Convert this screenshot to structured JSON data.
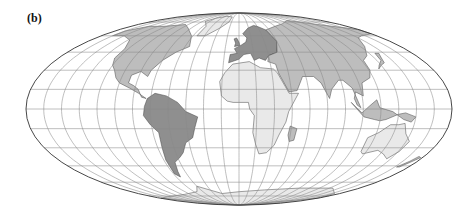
{
  "figure": {
    "panel_label": "(b)",
    "projection": "Mollweide",
    "graticule_spacing_deg": 15,
    "colors": {
      "background": "#ffffff",
      "graticule": "#8a8a8a",
      "outline": "#333333",
      "land_light": "#e9e9e9",
      "land_medium": "#bdbdbd",
      "land_dark": "#8f8f8f",
      "coastline": "#444444"
    },
    "frame": {
      "cx": 239,
      "cy": 109,
      "rx": 213,
      "ry": 96
    },
    "regions": [
      {
        "name": "north-america",
        "shade": "land_medium",
        "pts": [
          [
            -165,
            65
          ],
          [
            -150,
            70
          ],
          [
            -125,
            70
          ],
          [
            -95,
            72
          ],
          [
            -80,
            68
          ],
          [
            -62,
            60
          ],
          [
            -55,
            50
          ],
          [
            -66,
            45
          ],
          [
            -75,
            38
          ],
          [
            -81,
            30
          ],
          [
            -82,
            25
          ],
          [
            -90,
            29
          ],
          [
            -97,
            26
          ],
          [
            -97,
            20
          ],
          [
            -92,
            18
          ],
          [
            -87,
            15
          ],
          [
            -83,
            9
          ],
          [
            -79,
            8
          ],
          [
            -86,
            12
          ],
          [
            -95,
            16
          ],
          [
            -105,
            20
          ],
          [
            -110,
            24
          ],
          [
            -115,
            30
          ],
          [
            -120,
            34
          ],
          [
            -124,
            40
          ],
          [
            -124,
            48
          ],
          [
            -133,
            56
          ],
          [
            -150,
            60
          ],
          [
            -165,
            60
          ]
        ]
      },
      {
        "name": "greenland",
        "shade": "land_light",
        "pts": [
          [
            -55,
            60
          ],
          [
            -44,
            60
          ],
          [
            -30,
            68
          ],
          [
            -20,
            75
          ],
          [
            -20,
            82
          ],
          [
            -40,
            83
          ],
          [
            -60,
            80
          ],
          [
            -70,
            76
          ],
          [
            -55,
            70
          ]
        ]
      },
      {
        "name": "south-america",
        "shade": "land_dark",
        "pts": [
          [
            -78,
            8
          ],
          [
            -72,
            12
          ],
          [
            -62,
            10
          ],
          [
            -52,
            5
          ],
          [
            -45,
            -2
          ],
          [
            -35,
            -6
          ],
          [
            -38,
            -14
          ],
          [
            -41,
            -22
          ],
          [
            -48,
            -26
          ],
          [
            -53,
            -34
          ],
          [
            -58,
            -38
          ],
          [
            -65,
            -42
          ],
          [
            -68,
            -50
          ],
          [
            -70,
            -55
          ],
          [
            -74,
            -52
          ],
          [
            -73,
            -40
          ],
          [
            -71,
            -30
          ],
          [
            -70,
            -18
          ],
          [
            -76,
            -12
          ],
          [
            -81,
            -5
          ],
          [
            -80,
            2
          ]
        ]
      },
      {
        "name": "europe",
        "shade": "land_dark",
        "pts": [
          [
            -10,
            36
          ],
          [
            -9,
            43
          ],
          [
            -2,
            44
          ],
          [
            -5,
            48
          ],
          [
            2,
            51
          ],
          [
            8,
            54
          ],
          [
            10,
            58
          ],
          [
            5,
            62
          ],
          [
            14,
            68
          ],
          [
            25,
            71
          ],
          [
            30,
            70
          ],
          [
            40,
            66
          ],
          [
            45,
            55
          ],
          [
            40,
            45
          ],
          [
            30,
            42
          ],
          [
            26,
            38
          ],
          [
            20,
            40
          ],
          [
            15,
            38
          ],
          [
            12,
            44
          ],
          [
            5,
            43
          ],
          [
            0,
            39
          ]
        ]
      },
      {
        "name": "asia",
        "shade": "land_medium",
        "pts": [
          [
            40,
            66
          ],
          [
            60,
            70
          ],
          [
            80,
            73
          ],
          [
            105,
            77
          ],
          [
            140,
            72
          ],
          [
            170,
            68
          ],
          [
            180,
            66
          ],
          [
            180,
            62
          ],
          [
            160,
            60
          ],
          [
            150,
            58
          ],
          [
            140,
            50
          ],
          [
            130,
            42
          ],
          [
            122,
            38
          ],
          [
            121,
            30
          ],
          [
            117,
            24
          ],
          [
            108,
            20
          ],
          [
            106,
            10
          ],
          [
            100,
            13
          ],
          [
            98,
            8
          ],
          [
            100,
            3
          ],
          [
            103,
            1
          ],
          [
            98,
            16
          ],
          [
            92,
            22
          ],
          [
            88,
            22
          ],
          [
            80,
            15
          ],
          [
            77,
            8
          ],
          [
            72,
            20
          ],
          [
            67,
            25
          ],
          [
            57,
            25
          ],
          [
            55,
            22
          ],
          [
            50,
            14
          ],
          [
            43,
            13
          ],
          [
            36,
            28
          ],
          [
            35,
            35
          ],
          [
            28,
            37
          ],
          [
            30,
            42
          ],
          [
            40,
            45
          ],
          [
            45,
            55
          ]
        ]
      },
      {
        "name": "africa",
        "shade": "land_light",
        "pts": [
          [
            -17,
            21
          ],
          [
            -13,
            28
          ],
          [
            -6,
            35
          ],
          [
            10,
            37
          ],
          [
            20,
            32
          ],
          [
            32,
            31
          ],
          [
            35,
            28
          ],
          [
            43,
            12
          ],
          [
            51,
            12
          ],
          [
            42,
            -2
          ],
          [
            40,
            -10
          ],
          [
            35,
            -20
          ],
          [
            32,
            -28
          ],
          [
            26,
            -34
          ],
          [
            19,
            -35
          ],
          [
            15,
            -27
          ],
          [
            12,
            -18
          ],
          [
            13,
            -5
          ],
          [
            9,
            0
          ],
          [
            8,
            5
          ],
          [
            -5,
            5
          ],
          [
            -10,
            6
          ],
          [
            -15,
            10
          ]
        ]
      },
      {
        "name": "madagascar",
        "shade": "land_medium",
        "pts": [
          [
            44,
            -13
          ],
          [
            50,
            -15
          ],
          [
            49,
            -24
          ],
          [
            45,
            -25
          ],
          [
            43,
            -20
          ]
        ]
      },
      {
        "name": "australia",
        "shade": "land_light",
        "pts": [
          [
            114,
            -22
          ],
          [
            122,
            -18
          ],
          [
            130,
            -12
          ],
          [
            137,
            -12
          ],
          [
            142,
            -11
          ],
          [
            146,
            -19
          ],
          [
            153,
            -25
          ],
          [
            151,
            -33
          ],
          [
            146,
            -39
          ],
          [
            138,
            -35
          ],
          [
            130,
            -32
          ],
          [
            118,
            -35
          ],
          [
            115,
            -33
          ]
        ]
      },
      {
        "name": "indonesia",
        "shade": "land_medium",
        "pts": [
          [
            95,
            5
          ],
          [
            106,
            -6
          ],
          [
            115,
            -8
          ],
          [
            120,
            -9
          ],
          [
            125,
            -8
          ],
          [
            135,
            -4
          ],
          [
            141,
            -3
          ],
          [
            150,
            -6
          ],
          [
            147,
            -10
          ],
          [
            140,
            -8
          ],
          [
            130,
            -2
          ],
          [
            119,
            1
          ],
          [
            117,
            7
          ],
          [
            110,
            2
          ],
          [
            104,
            -3
          ]
        ]
      },
      {
        "name": "new-zealand",
        "shade": "land_medium",
        "pts": [
          [
            167,
            -46
          ],
          [
            172,
            -41
          ],
          [
            175,
            -37
          ],
          [
            178,
            -38
          ],
          [
            174,
            -42
          ],
          [
            170,
            -46
          ]
        ]
      },
      {
        "name": "japan",
        "shade": "land_medium",
        "pts": [
          [
            130,
            31
          ],
          [
            135,
            34
          ],
          [
            140,
            36
          ],
          [
            142,
            40
          ],
          [
            145,
            44
          ],
          [
            141,
            44
          ],
          [
            139,
            38
          ],
          [
            133,
            34
          ]
        ]
      },
      {
        "name": "uk",
        "shade": "land_dark",
        "pts": [
          [
            -5,
            50
          ],
          [
            1,
            51
          ],
          [
            0,
            54
          ],
          [
            -3,
            58
          ],
          [
            -6,
            57
          ],
          [
            -4,
            53
          ]
        ]
      },
      {
        "name": "antarctica-edge",
        "shade": "land_light",
        "pts": [
          [
            -60,
            -64
          ],
          [
            -30,
            -72
          ],
          [
            0,
            -70
          ],
          [
            40,
            -68
          ],
          [
            90,
            -66
          ],
          [
            140,
            -66
          ],
          [
            170,
            -72
          ],
          [
            180,
            -78
          ],
          [
            180,
            -90
          ],
          [
            -180,
            -90
          ],
          [
            -180,
            -78
          ],
          [
            -150,
            -76
          ],
          [
            -100,
            -73
          ],
          [
            -70,
            -70
          ]
        ]
      }
    ]
  }
}
